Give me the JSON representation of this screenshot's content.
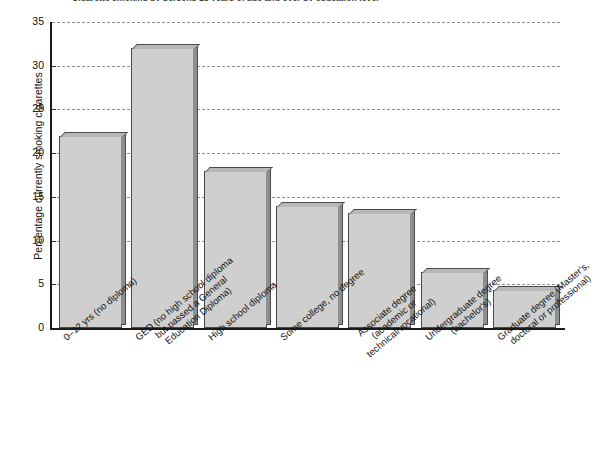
{
  "chart_data": {
    "type": "bar",
    "title": "Cigarette smoking by persons 25 years of age and over by education level",
    "xlabel": "",
    "ylabel": "Percentage currently smoking cigarettes",
    "ylim": [
      0,
      35
    ],
    "yticks": [
      0,
      5,
      10,
      15,
      20,
      25,
      30,
      35
    ],
    "grid": true,
    "legend": "none",
    "categories": [
      "0–12 yrs (no diploma)",
      "GED (no high school diploma but passed a General Education Diploma)",
      "High school diploma",
      "Some college, no degree",
      "Associate degree (academic or technical/vocational)",
      "Undergraduate degree (bachelor's)",
      "Graduate degree (Master's, doctoral or professional)"
    ],
    "category_lines": [
      [
        "0–12 yrs (no diploma)"
      ],
      [
        "GED (no high school diploma",
        "but passed a General",
        "Education Diploma)"
      ],
      [
        "High school diploma"
      ],
      [
        "Some college, no degree"
      ],
      [
        "Associate degree",
        "(academic or",
        "technical/vocational)"
      ],
      [
        "Undergraduate degree",
        "(bachelor's)"
      ],
      [
        "Graduate degree (Master's,",
        "doctoral or professional)"
      ]
    ],
    "values": [
      22,
      32,
      18,
      14,
      13.2,
      6.4,
      4.3
    ]
  },
  "colors": {
    "bar_face": "#cfcfcf",
    "bar_side": "#8e8e8e",
    "bar_top": "#b8b8b8",
    "bar_edge": "#4a4a4a",
    "axis": "#1a1a1a",
    "gridline": "#8c8c8c",
    "text": "#111111",
    "background": "#ffffff"
  }
}
